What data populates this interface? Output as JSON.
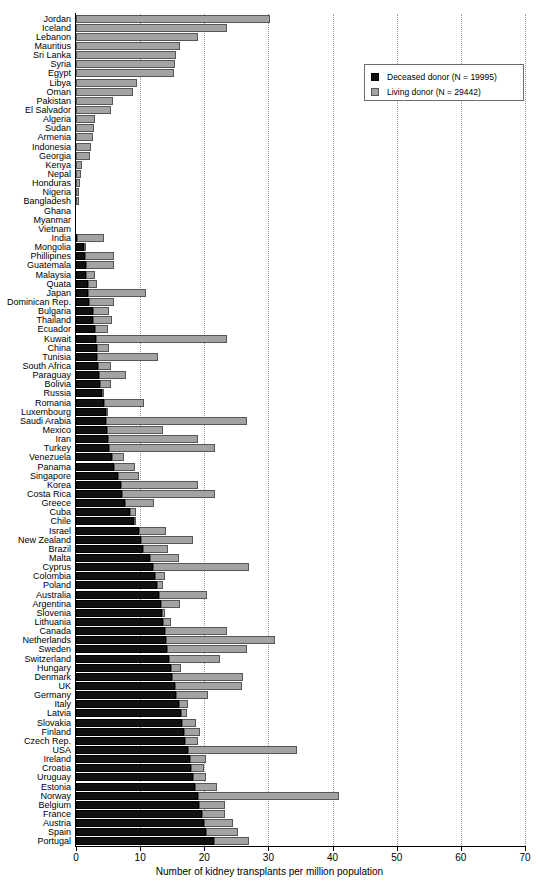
{
  "chart_data": {
    "type": "bar",
    "orientation": "horizontal",
    "stacked": true,
    "title": "",
    "xlabel": "Number of kidney transplants per million population",
    "ylabel": "",
    "xlim": [
      0,
      70
    ],
    "xticks": [
      0,
      10,
      20,
      30,
      40,
      50,
      60,
      70
    ],
    "grid": "vertical-dotted",
    "legend_position": "top-right",
    "colors": {
      "deceased": "#111111",
      "living": "#a3a3a3",
      "background": "#ffffff",
      "axis": "#000000",
      "gridline": "#9a9a9a"
    },
    "series": [
      {
        "name": "Deceased donor (N = 19995)",
        "key": "deceased"
      },
      {
        "name": "Living donor (N = 29442)",
        "key": "living"
      }
    ],
    "categories": [
      "Jordan",
      "Iceland",
      "Lebanon",
      "Mauritius",
      "Sri Lanka",
      "Syria",
      "Egypt",
      "Libya",
      "Oman",
      "Pakistan",
      "El Salvador",
      "Algeria",
      "Sudan",
      "Armenia",
      "Indonesia",
      "Georgia",
      "Kenya",
      "Nepal",
      "Honduras",
      "Nigeria",
      "Bangladesh",
      "Ghana",
      "Myanmar",
      "Vietnam",
      "India",
      "Mongolia",
      "Phillipines",
      "Guatemala",
      "Malaysia",
      "Quata",
      "Japan",
      "Dominican Rep.",
      "Bulgaria",
      "Thailand",
      "Ecuador",
      "Kuwait",
      "China",
      "Tunisia",
      "South Africa",
      "Paraguay",
      "Bolivia",
      "Russia",
      "Romania",
      "Luxembourg",
      "Saudi Arabia",
      "Mexico",
      "Iran",
      "Turkey",
      "Venezuela",
      "Panama",
      "Singapore",
      "Korea",
      "Costa Rica",
      "Greece",
      "Cuba",
      "Chile",
      "Israel",
      "New Zealand",
      "Brazil",
      "Malta",
      "Cyprus",
      "Colombia",
      "Poland",
      "Australia",
      "Argentina",
      "Slovenia",
      "Lithuania",
      "Canada",
      "Netherlands",
      "Sweden",
      "Switzerland",
      "Hungary",
      "Denmark",
      "UK",
      "Germany",
      "Italy",
      "Latvia",
      "Slovakia",
      "Finland",
      "Czech Rep.",
      "USA",
      "Ireland",
      "Croatia",
      "Uruguay",
      "Estonia",
      "Norway",
      "Belgium",
      "France",
      "Austria",
      "Spain",
      "Portugal"
    ],
    "values": {
      "deceased": [
        0.0,
        0.0,
        0.0,
        0.0,
        0.0,
        0.0,
        0.0,
        0.0,
        0.0,
        0.0,
        0.0,
        0.0,
        0.0,
        0.0,
        0.0,
        0.0,
        0.0,
        0.0,
        0.0,
        0.0,
        0.0,
        0.0,
        0.0,
        0.0,
        0.1,
        1.3,
        1.4,
        1.5,
        1.6,
        1.8,
        1.9,
        2.0,
        2.6,
        2.7,
        3.0,
        3.1,
        3.2,
        3.3,
        3.5,
        3.6,
        3.8,
        4.1,
        4.3,
        4.6,
        4.7,
        4.9,
        5.0,
        5.2,
        5.6,
        6.0,
        6.5,
        7.0,
        7.2,
        7.7,
        8.4,
        9.0,
        9.8,
        10.2,
        10.5,
        11.5,
        12.0,
        12.3,
        12.6,
        13.0,
        13.2,
        13.4,
        13.6,
        13.8,
        14.0,
        14.2,
        14.5,
        14.8,
        15.0,
        15.4,
        15.6,
        16.0,
        16.3,
        16.5,
        16.8,
        17.0,
        17.4,
        17.7,
        17.9,
        18.2,
        18.5,
        19.0,
        19.2,
        19.6,
        20.0,
        20.3,
        21.5
      ],
      "living": [
        30.2,
        23.6,
        19.0,
        16.2,
        15.6,
        15.5,
        15.3,
        9.5,
        8.9,
        5.7,
        5.5,
        3.0,
        2.8,
        2.6,
        2.4,
        2.2,
        0.9,
        0.8,
        0.7,
        0.5,
        0.4,
        0.0,
        0.0,
        0.0,
        4.3,
        0.3,
        4.6,
        4.4,
        1.4,
        1.5,
        9.0,
        4.0,
        2.5,
        2.9,
        2.0,
        20.5,
        2.0,
        9.5,
        2.0,
        4.2,
        1.6,
        0.2,
        6.3,
        0.2,
        22.0,
        8.6,
        14.0,
        16.5,
        1.9,
        3.2,
        3.3,
        12.0,
        14.5,
        4.5,
        1.0,
        0.2,
        4.2,
        8.0,
        3.8,
        4.5,
        15.0,
        1.5,
        1.0,
        7.5,
        3.0,
        0.5,
        1.2,
        9.8,
        17.0,
        12.5,
        8.0,
        1.5,
        11.0,
        10.5,
        5.0,
        1.5,
        1.0,
        2.2,
        2.5,
        2.0,
        17.0,
        2.5,
        2.0,
        2.0,
        3.5,
        22.0,
        4.0,
        3.6,
        4.5,
        5.0,
        5.5
      ]
    }
  },
  "legend": {
    "items": [
      {
        "label": "Deceased donor (N = 19995)",
        "swatch": "deceased"
      },
      {
        "label": "Living donor (N = 29442)",
        "swatch": "living"
      }
    ]
  },
  "axis": {
    "x_title": "Number of kidney transplants per million population",
    "x_tick_labels": [
      "0",
      "10",
      "20",
      "30",
      "40",
      "50",
      "60",
      "70"
    ]
  }
}
